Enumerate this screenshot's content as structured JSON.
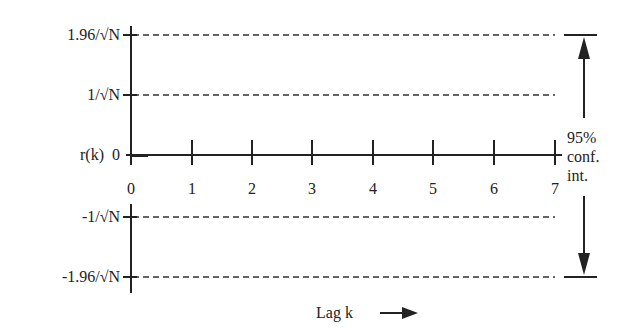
{
  "diagram": {
    "y_labels": {
      "upper_95": "1.96/√N",
      "upper_1se": "1/√N",
      "zero": "r(k)  0",
      "lower_1se": "-1/√N",
      "lower_95": "-1.96/√N"
    },
    "x_ticks": [
      "0",
      "1",
      "2",
      "3",
      "4",
      "5",
      "6",
      "7"
    ],
    "x_axis_label": "Lag k",
    "annotation": {
      "line1": "95%",
      "line2": "conf.",
      "line3": "int."
    },
    "colors": {
      "line": "#222222",
      "dashed": "#333333",
      "background": "#ffffff"
    }
  }
}
